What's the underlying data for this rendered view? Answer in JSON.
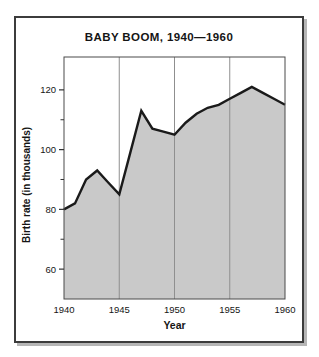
{
  "figure": {
    "title": "BABY BOOM, 1940—1960"
  },
  "chart_data": {
    "type": "area",
    "title": "BABY BOOM, 1940—1960",
    "xlabel": "Year",
    "ylabel": "Birth rate (in thousands)",
    "x": [
      1940,
      1941,
      1942,
      1943,
      1944,
      1945,
      1946,
      1947,
      1948,
      1949,
      1950,
      1951,
      1952,
      1953,
      1954,
      1955,
      1956,
      1957,
      1958,
      1959,
      1960
    ],
    "values": [
      80,
      82,
      90,
      93,
      89,
      85,
      99,
      113,
      107,
      106,
      105,
      109,
      112,
      114,
      115,
      117,
      119,
      121,
      119,
      117,
      115
    ],
    "xlim": [
      1940,
      1960
    ],
    "ylim": [
      50,
      131
    ],
    "x_tick_labels": [
      1940,
      1945,
      1950,
      1955,
      1960
    ],
    "y_major_ticks": [
      120,
      100,
      80,
      60
    ],
    "y_minor_ticks": [
      110,
      90,
      70
    ],
    "x_gridlines": [
      1945,
      1950,
      1955
    ],
    "grid": "vertical-only",
    "legend": "none",
    "colors": {
      "area_fill": "#c9c9c9",
      "line": "#1a1a1a",
      "gridline": "#8f8f8f",
      "frame": "#4a4a4a",
      "tick": "#333333",
      "text": "#151515"
    }
  }
}
